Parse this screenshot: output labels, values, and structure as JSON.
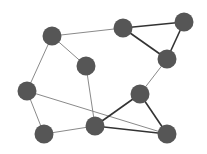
{
  "diagram": {
    "type": "undirected-graph",
    "node_color": "#565656",
    "node_radius": 9.5,
    "edge_colors": {
      "thin": "#8a8a8a",
      "thick": "#333333"
    },
    "nodes": [
      {
        "id": "A",
        "x": 52,
        "y": 36
      },
      {
        "id": "B",
        "x": 123,
        "y": 28
      },
      {
        "id": "C",
        "x": 184,
        "y": 22
      },
      {
        "id": "D",
        "x": 167,
        "y": 59
      },
      {
        "id": "E",
        "x": 86,
        "y": 66
      },
      {
        "id": "F",
        "x": 27,
        "y": 91
      },
      {
        "id": "G",
        "x": 140,
        "y": 94
      },
      {
        "id": "H",
        "x": 95,
        "y": 126
      },
      {
        "id": "I",
        "x": 44,
        "y": 134
      },
      {
        "id": "J",
        "x": 167,
        "y": 134
      }
    ],
    "edges": [
      {
        "from": "A",
        "to": "B",
        "style": "thin"
      },
      {
        "from": "A",
        "to": "E",
        "style": "thin"
      },
      {
        "from": "A",
        "to": "F",
        "style": "thin"
      },
      {
        "from": "B",
        "to": "C",
        "style": "thick"
      },
      {
        "from": "B",
        "to": "D",
        "style": "thick"
      },
      {
        "from": "C",
        "to": "D",
        "style": "thick"
      },
      {
        "from": "D",
        "to": "G",
        "style": "thin"
      },
      {
        "from": "E",
        "to": "H",
        "style": "thin"
      },
      {
        "from": "F",
        "to": "I",
        "style": "thin"
      },
      {
        "from": "F",
        "to": "J",
        "style": "thin"
      },
      {
        "from": "I",
        "to": "H",
        "style": "thin"
      },
      {
        "from": "G",
        "to": "H",
        "style": "thick"
      },
      {
        "from": "G",
        "to": "J",
        "style": "thick"
      },
      {
        "from": "H",
        "to": "J",
        "style": "thick"
      }
    ]
  }
}
